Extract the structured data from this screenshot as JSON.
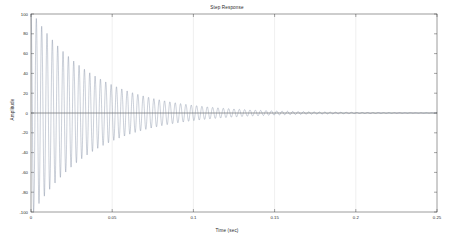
{
  "chart_data": {
    "type": "line",
    "title": "Step Response",
    "xlabel": "Time (sec)",
    "ylabel": "Amplitude",
    "xlim": [
      0,
      0.25
    ],
    "ylim": [
      -100,
      100
    ],
    "xticks": [
      0,
      0.05,
      0.1,
      0.15,
      0.2,
      0.25
    ],
    "xticklabels": [
      "0",
      "0.05",
      "0.1",
      "0.15",
      "0.2",
      "0.25"
    ],
    "yticks": [
      -100,
      -80,
      -60,
      -40,
      -20,
      0,
      20,
      40,
      60,
      80,
      100
    ],
    "yticklabels": [
      "-100",
      "-80",
      "-60",
      "-40",
      "-20",
      "0",
      "20",
      "40",
      "60",
      "80",
      "100"
    ],
    "grid": true,
    "legend": "none",
    "series": [
      {
        "name": "response",
        "color": "#5a6a86",
        "linewidth": 0.35,
        "waveform": "damped_sine",
        "amplitude": 104,
        "decay_rate": 26.0,
        "frequency_hz": 304,
        "phase_rad": 1.5708,
        "offset": 0,
        "n_samples": 4200,
        "description": "Exponentially damped oscillation decaying from about +/-100 at t=0 to near zero by t=0.22"
      }
    ],
    "sampled_envelope": {
      "t": [
        0,
        0.0125,
        0.025,
        0.0375,
        0.05,
        0.0625,
        0.075,
        0.0875,
        0.1,
        0.1125,
        0.125,
        0.1375,
        0.15,
        0.1625,
        0.175,
        0.1875,
        0.2,
        0.2125,
        0.225,
        0.2375,
        0.25
      ],
      "upper": [
        104,
        75,
        54.4,
        39.3,
        28.4,
        20.6,
        14.9,
        10.8,
        7.8,
        5.6,
        4.1,
        2.9,
        2.1,
        1.5,
        1.1,
        0.8,
        0.6,
        0.4,
        0.3,
        0.2,
        0.16
      ],
      "lower": [
        -104,
        -75,
        -54.4,
        -39.3,
        -28.4,
        -20.6,
        -14.9,
        -10.8,
        -7.8,
        -5.6,
        -4.1,
        -2.9,
        -2.1,
        -1.5,
        -1.1,
        -0.8,
        -0.6,
        -0.4,
        -0.3,
        -0.2,
        -0.16
      ]
    },
    "axis_color": "#3a3a3a",
    "grid_color": "#d9d9d9",
    "background": "#ffffff"
  },
  "plot_box": {
    "left": 31,
    "top": 14,
    "right": 437,
    "bottom": 212
  }
}
